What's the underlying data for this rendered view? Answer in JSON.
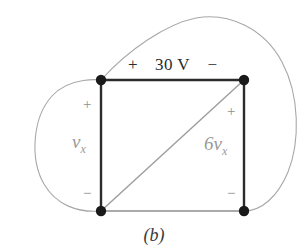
{
  "figure": {
    "caption": "(b)",
    "type": "circuit-diagram"
  },
  "colors": {
    "background": "#ffffff",
    "wire_dark": "#2b2b2b",
    "wire_light": "#9d9d9d",
    "loop_curve": "#a8a8a8",
    "node": "#1a1a1a",
    "text_dark": "#2b2b2b",
    "text_gray": "#9a9a9a"
  },
  "source": {
    "plus": "+",
    "value": "30 V",
    "minus": "−"
  },
  "elements": [
    {
      "name": "independent-voltage-source",
      "label": "30 V",
      "plus": "+",
      "minus": "−",
      "position": "top"
    },
    {
      "name": "vx-branch",
      "label_main": "v",
      "label_sub": "x",
      "plus": "+",
      "minus": "−",
      "position": "left"
    },
    {
      "name": "dependent-source-6vx",
      "label_main": "6v",
      "label_sub": "x",
      "plus": "+",
      "minus": "−",
      "position": "right"
    }
  ],
  "nodes": [
    {
      "name": "node-top-left",
      "x": 101,
      "y": 80
    },
    {
      "name": "node-top-right",
      "x": 244,
      "y": 80
    },
    {
      "name": "node-bottom-left",
      "x": 101,
      "y": 211
    },
    {
      "name": "node-bottom-right",
      "x": 244,
      "y": 211
    }
  ],
  "vx": {
    "main": "v",
    "sub": "x"
  },
  "dependent": {
    "main": "6v",
    "sub": "x"
  }
}
